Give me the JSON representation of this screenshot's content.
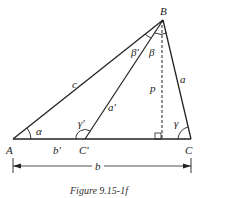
{
  "figure": {
    "caption": "Figure 9.15-1f",
    "colors": {
      "stroke": "#222222",
      "background": "#ffffff"
    },
    "vertices": {
      "A": {
        "label": "A",
        "x": 13,
        "y": 139
      },
      "B": {
        "label": "B",
        "x": 163,
        "y": 20
      },
      "C": {
        "label": "C",
        "x": 191,
        "y": 139
      },
      "Cprime": {
        "label": "C′",
        "x": 85,
        "y": 139
      },
      "foot": {
        "x": 162,
        "y": 139
      }
    },
    "sides": {
      "a": "a",
      "c": "c",
      "a_prime": "a′",
      "b_prime": "b′",
      "p": "p",
      "b": "b"
    },
    "angles": {
      "alpha": "α",
      "beta": "β",
      "beta_prime": "β′",
      "gamma": "γ",
      "gamma_prime": "γ′"
    }
  }
}
